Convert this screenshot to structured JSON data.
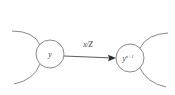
{
  "diagram": {
    "type": "directed-graph-transition",
    "background_color": "#ffffff",
    "stroke_color": "#6b6b6b",
    "text_color": "#3a3a3a",
    "nodes": [
      {
        "id": "source",
        "label_main": "y",
        "label_sup": "",
        "cx": 50,
        "cy": 54,
        "r": 14
      },
      {
        "id": "target",
        "label_main": "y",
        "label_sup": "n+1",
        "cx": 130,
        "cy": 58,
        "r": 14
      }
    ],
    "edge": {
      "label": "x/Z",
      "from": "source",
      "to": "target",
      "label_x": 88,
      "label_y": 47
    },
    "arcs": [
      {
        "id": "left-upper-arc",
        "d": "M 12 31 Q 34 31 40 45"
      },
      {
        "id": "left-lower-arc",
        "d": "M 14 84 Q 34 80 40 64"
      },
      {
        "id": "right-upper-arc",
        "d": "M 168 33 Q 147 34 140 48"
      },
      {
        "id": "right-lower-arc",
        "d": "M 166 87 Q 147 83 140 68"
      }
    ]
  }
}
